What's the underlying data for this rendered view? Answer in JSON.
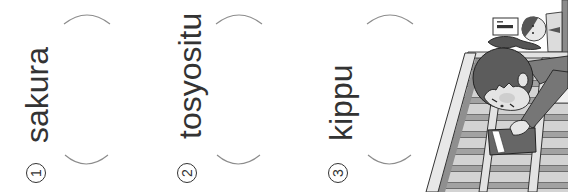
{
  "worksheet": {
    "items": [
      {
        "number": "1",
        "word": "sakura"
      },
      {
        "number": "2",
        "word": "tosyositu"
      },
      {
        "number": "3",
        "word": "kippu"
      }
    ]
  },
  "colors": {
    "text": "#333333",
    "bracket": "#8c8c8c"
  },
  "illustration": {
    "icon": "girl-picking-up-ticket-on-escalator-illustration"
  }
}
